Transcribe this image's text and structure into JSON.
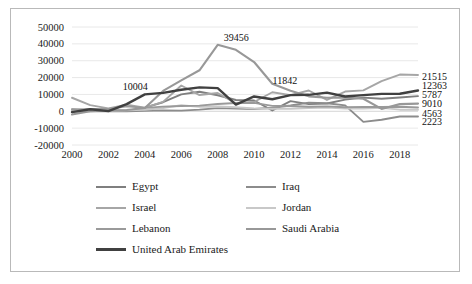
{
  "chart_data": {
    "type": "line",
    "title": "",
    "xlabel": "",
    "ylabel": "",
    "x": [
      2000,
      2001,
      2002,
      2003,
      2004,
      2005,
      2006,
      2007,
      2008,
      2009,
      2010,
      2011,
      2012,
      2013,
      2014,
      2015,
      2016,
      2017,
      2018,
      2019
    ],
    "xlim": [
      2000,
      2019
    ],
    "ylim": [
      -20000,
      50000
    ],
    "xticks": [
      "2000",
      "2002",
      "2004",
      "2006",
      "2008",
      "2010",
      "2012",
      "2014",
      "2016",
      "2018"
    ],
    "yticks": [
      "-20000",
      "-10000",
      "0",
      "10000",
      "20000",
      "30000",
      "40000",
      "50000"
    ],
    "grid": true,
    "legend_position": "bottom",
    "series": [
      {
        "name": "Egypt",
        "color": "#7f7f7f",
        "width": 1.9,
        "values": [
          1235,
          510,
          647,
          237,
          2157,
          5376,
          10043,
          11578,
          9495,
          6712,
          6386,
          483,
          6031,
          4256,
          4612,
          6925,
          8107,
          7409,
          8141,
          9010
        ]
      },
      {
        "name": "Iraq",
        "color": "#8c8c8c",
        "width": 1.9,
        "values": [
          -3,
          -6,
          -7,
          -1,
          300,
          515,
          383,
          972,
          1856,
          1598,
          1396,
          2082,
          3400,
          5131,
          4782,
          3500,
          -6256,
          -5031,
          -3114,
          -3070
        ]
      },
      {
        "name": "Israel",
        "color": "#a6a6a6",
        "width": 1.9,
        "values": [
          8033,
          3683,
          1721,
          3950,
          2170,
          5587,
          15293,
          9641,
          10875,
          4607,
          5510,
          11310,
          9556,
          12342,
          6738,
          11694,
          12395,
          17927,
          21803,
          21515
        ]
      },
      {
        "name": "Jordan",
        "color": "#c8c8c8",
        "width": 1.9,
        "values": [
          913,
          272,
          238,
          547,
          937,
          1984,
          3544,
          2622,
          2826,
          2413,
          1651,
          1474,
          1548,
          1948,
          2177,
          1600,
          1553,
          2030,
          955,
          916
        ]
      },
      {
        "name": "Lebanon",
        "color": "#9a9a9a",
        "width": 1.9,
        "values": [
          964,
          1451,
          1336,
          2977,
          1993,
          2791,
          3132,
          3376,
          4333,
          4955,
          4955,
          3206,
          3111,
          2662,
          2907,
          2353,
          2610,
          2536,
          2655,
          2223
        ]
      },
      {
        "name": "Saudi Arabia",
        "color": "#989898",
        "width": 2.1,
        "values": [
          -1884,
          20,
          453,
          778,
          1942,
          12097,
          18293,
          24319,
          39456,
          36458,
          29233,
          16308,
          12182,
          8865,
          8012,
          8141,
          7453,
          1419,
          4247,
          4563
        ]
      },
      {
        "name": "United Arab Emirates",
        "color": "#404040",
        "width": 2.4,
        "values": [
          -506,
          1184,
          95,
          4256,
          10004,
          10900,
          12806,
          14187,
          13724,
          4003,
          8797,
          7152,
          9602,
          9765,
          11066,
          8795,
          9605,
          10354,
          10385,
          12363
        ]
      }
    ],
    "inline_labels": [
      {
        "text": "10004",
        "series": "United Arab Emirates",
        "year": 2004,
        "value": 10004
      },
      {
        "text": "39456",
        "series": "Saudi Arabia",
        "year": 2008,
        "value": 39456
      },
      {
        "text": "11842",
        "series": "United Arab Emirates",
        "year": 2012,
        "value": 11842
      }
    ],
    "end_labels": [
      {
        "text": "21515",
        "series": "Israel",
        "value": 21515
      },
      {
        "text": "12363",
        "series": "United Arab Emirates",
        "value": 12363
      },
      {
        "text": "5787",
        "series": "Egypt",
        "value": 5787
      },
      {
        "text": "9010",
        "series": "Egypt",
        "value": 9010
      },
      {
        "text": "4563",
        "series": "Saudi Arabia",
        "value": 4563
      },
      {
        "text": "2223",
        "series": "Lebanon",
        "value": 2223
      }
    ]
  },
  "legend": {
    "items": [
      {
        "label": "Egypt",
        "color": "#7f7f7f"
      },
      {
        "label": "Iraq",
        "color": "#8c8c8c"
      },
      {
        "label": "Israel",
        "color": "#a6a6a6"
      },
      {
        "label": "Jordan",
        "color": "#c8c8c8"
      },
      {
        "label": "Lebanon",
        "color": "#9a9a9a"
      },
      {
        "label": "Saudi Arabia",
        "color": "#989898"
      },
      {
        "label": "United Arab Emirates",
        "color": "#404040"
      }
    ]
  }
}
